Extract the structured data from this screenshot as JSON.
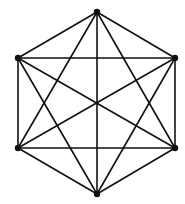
{
  "diagram": {
    "type": "complete-graph",
    "name": "K6",
    "layout": "regular-hexagon",
    "vertices": [
      {
        "id": "A",
        "position": "top"
      },
      {
        "id": "B",
        "position": "upper-right"
      },
      {
        "id": "C",
        "position": "lower-right"
      },
      {
        "id": "D",
        "position": "bottom"
      },
      {
        "id": "E",
        "position": "lower-left"
      },
      {
        "id": "F",
        "position": "upper-left"
      }
    ],
    "edges": [
      [
        "A",
        "B"
      ],
      [
        "A",
        "C"
      ],
      [
        "A",
        "D"
      ],
      [
        "A",
        "E"
      ],
      [
        "A",
        "F"
      ],
      [
        "B",
        "C"
      ],
      [
        "B",
        "D"
      ],
      [
        "B",
        "E"
      ],
      [
        "B",
        "F"
      ],
      [
        "C",
        "D"
      ],
      [
        "C",
        "E"
      ],
      [
        "C",
        "F"
      ],
      [
        "D",
        "E"
      ],
      [
        "D",
        "F"
      ],
      [
        "E",
        "F"
      ]
    ],
    "colors": {
      "edge": "#111111",
      "vertex": "#111111",
      "background": "#ffffff"
    }
  }
}
